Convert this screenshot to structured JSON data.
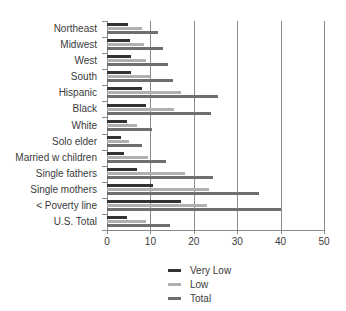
{
  "chart_data": {
    "type": "bar",
    "orientation": "horizontal",
    "title": "",
    "subtitle": "",
    "xlabel": "",
    "ylabel": "",
    "xlim": [
      0,
      50
    ],
    "xticks": [
      0,
      10,
      20,
      30,
      40,
      50
    ],
    "xtick_labels": [
      "0",
      "10",
      "20",
      "30",
      "40",
      "50"
    ],
    "grid": "vertical",
    "legend_position": "bottom-center",
    "categories": [
      "Northeast",
      "Midwest",
      "West",
      "South",
      "Hispanic",
      "Black",
      "White",
      "Solo elder",
      "Married w children",
      "Single fathers",
      "Single mothers",
      "< Poverty line",
      "U.S. Total"
    ],
    "series": [
      {
        "name": "Very Low",
        "color": "#333333",
        "values": [
          4.8,
          5.2,
          5.5,
          5.5,
          8.0,
          9.0,
          4.7,
          3.3,
          4.0,
          7.0,
          10.5,
          17.0,
          4.7
        ]
      },
      {
        "name": "Low",
        "color": "#b0b0b0",
        "values": [
          8.0,
          8.5,
          9.0,
          10.0,
          17.0,
          15.5,
          7.0,
          5.0,
          9.5,
          18.0,
          23.5,
          23.0,
          9.0
        ]
      },
      {
        "name": "Total",
        "color": "#6e6e6e",
        "values": [
          11.8,
          12.8,
          14.0,
          15.3,
          25.5,
          24.0,
          10.3,
          8.0,
          13.5,
          24.5,
          35.0,
          40.0,
          14.5
        ]
      }
    ]
  },
  "legend": {
    "items": [
      {
        "label": "Very Low",
        "color": "#333333"
      },
      {
        "label": "Low",
        "color": "#b0b0b0"
      },
      {
        "label": "Total",
        "color": "#6e6e6e"
      }
    ]
  },
  "axis": {
    "x_tick_labels": [
      "0",
      "10",
      "20",
      "30",
      "40",
      "50"
    ]
  }
}
